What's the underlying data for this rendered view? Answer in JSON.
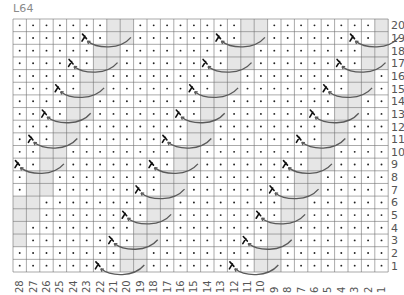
{
  "title": "L64",
  "grid": {
    "columns": 28,
    "rows": 20,
    "legend": {
      "dot": "purl",
      "gray": "knit (shaded)",
      "cable": "travelling stitch symbol"
    },
    "colors": {
      "gray": "#e6e6e6",
      "grid_line": "#707070",
      "dot": "#222222",
      "arrow": "#5a5a5a",
      "label": "#555555"
    },
    "row_labels": [
      "20",
      "19",
      "18",
      "17",
      "16",
      "15",
      "14",
      "13",
      "12",
      "11",
      "10",
      "9",
      "8",
      "7",
      "6",
      "5",
      "4",
      "3",
      "2",
      "1"
    ],
    "column_labels": [
      "28",
      "27",
      "26",
      "25",
      "24",
      "23",
      "22",
      "21",
      "20",
      "19",
      "18",
      "17",
      "16",
      "15",
      "14",
      "13",
      "12",
      "11",
      "10",
      "9",
      "8",
      "7",
      "6",
      "5",
      "4",
      "3",
      "2",
      "1"
    ],
    "row_cells": {
      "20": ".......kk........kk........k",
      "19": ".....c.kk......c.kk......c.k",
      "18": "......kk........kk........kk",
      "17": "....c.kk......c.kk......c.kk",
      "16": ".....kk........kk........kk.",
      "15": "...c.kk......c.kk......c.kk.",
      "14": "....kk........kk........kk..",
      "13": "..c.kk......c.kk......c.kk..",
      "12": "...kk........kk........kk...",
      "11": ".c.kk......c.kk......c.kk...",
      "10": "..kk........kk........kk....",
      "9": "c.kk......c.kk......c.kk....",
      "8": ".kk........kk........kk.....",
      "7": ".kk......c.kk......c.kk.....",
      "6": "kk........kk........kk......",
      "5": "kk......c.kk......c.kk......",
      "4": "k........kk........kk.......",
      "3": "k......c.kk......c.kk.......",
      "2": "........kk........kk........",
      "1": "......c.kk......c.kk........"
    }
  }
}
